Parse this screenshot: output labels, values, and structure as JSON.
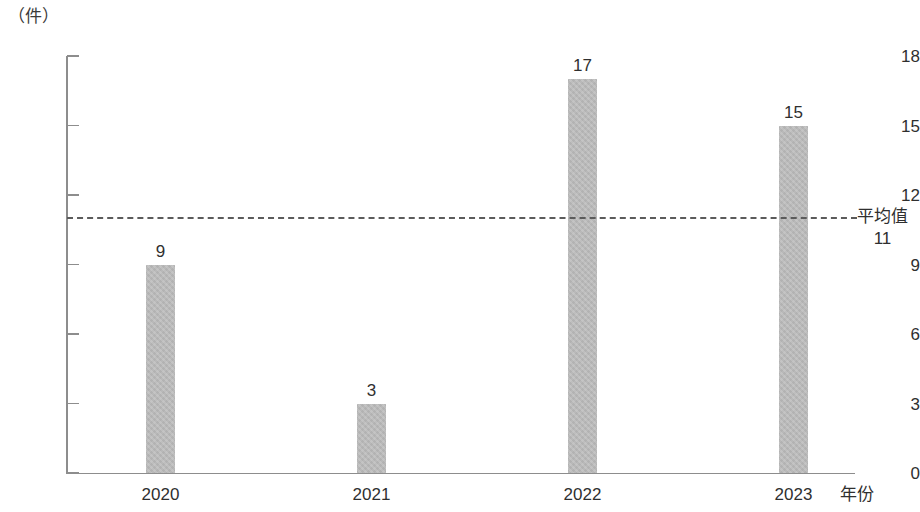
{
  "chart_data": {
    "type": "bar",
    "title": "",
    "subtitle": "",
    "xlabel": "年份",
    "ylabel": "（件）",
    "categories": [
      "2020",
      "2021",
      "2022",
      "2023"
    ],
    "values": [
      9,
      3,
      17,
      15
    ],
    "ylim": [
      0,
      18
    ],
    "yticks": [
      0,
      3,
      6,
      9,
      12,
      15,
      18
    ],
    "ytick_labels": [
      "0",
      "3",
      "6",
      "9",
      "12",
      "15",
      "18"
    ],
    "grid": false,
    "legend": null,
    "bar_labels": [
      "9",
      "3",
      "17",
      "15"
    ],
    "annotations": [
      {
        "name": "average-line",
        "type": "hline",
        "value": 11,
        "label": "平均值",
        "value_label": "11",
        "style": "dashed",
        "label_position": "right"
      }
    ],
    "colors": {
      "bar_fill": "#b9b9b9",
      "axis": "#8d8d8d",
      "text": "#2f2f2f",
      "average_line": "#5b5b5b"
    }
  }
}
